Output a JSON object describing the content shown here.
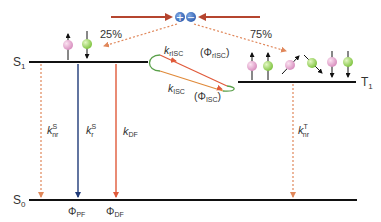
{
  "diagram": {
    "type": "Jablonski energy diagram (TADF)",
    "levels": {
      "s1": "S",
      "s1_sub": "1",
      "t1": "T",
      "t1_sub": "1",
      "s0": "S",
      "s0_sub": "0"
    },
    "percent_singlet": "25%",
    "percent_triplet": "75%",
    "charges": {
      "plus": "+",
      "minus": "−"
    },
    "rates": {
      "k": "k",
      "knr_s_sup": "S",
      "knr_s_sub": "nr",
      "kr_s_sup": "S",
      "kr_s_sub": "r",
      "kdf_sub": "DF",
      "krisc_sub": "rISC",
      "kisc_sub": "ISC",
      "knr_t_sup": "T",
      "knr_t_sub": "nr"
    },
    "yields": {
      "phi": "Φ",
      "pf_sub": "PF",
      "df_sub": "DF",
      "risc_open": "(Φ",
      "risc_sub": "rISC",
      "risc_close": ")",
      "isc_open": "(Φ",
      "isc_sub": "ISC",
      "isc_close": ")"
    },
    "colors": {
      "level_line": "#111111",
      "charge_arrow": "#b5452f",
      "dotted_arrow": "#e0875a",
      "prompt_fluorescence": "#1f3a78",
      "delayed_fluorescence": "#e05a3a",
      "isc_loop": "#5aa04a",
      "charge_fill": "#3a6fc0",
      "pink_sphere": "#e9a6cf",
      "green_sphere": "#9ed65a"
    }
  }
}
